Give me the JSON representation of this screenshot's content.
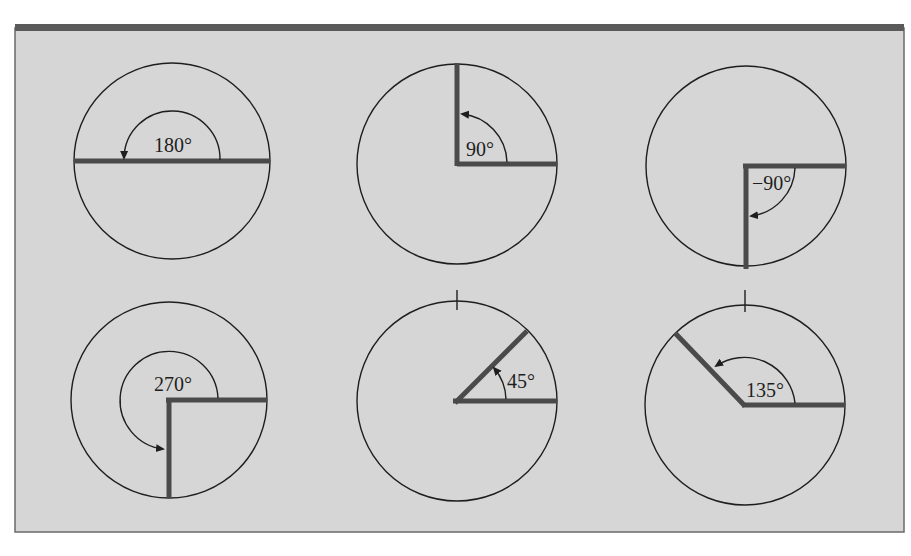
{
  "figure": {
    "colors": {
      "panel_background": "#d6d6d6",
      "panel_border": "#5a5a5a",
      "circle_stroke": "#1e1e1e",
      "ray_color": "#4a4a4a",
      "text_color": "#1e1e1e"
    },
    "panels": [
      {
        "id": "angle-180",
        "label": "180°",
        "angle_deg": 180,
        "direction": "counterclockwise",
        "has_top_tick": false
      },
      {
        "id": "angle-90",
        "label": "90°",
        "angle_deg": 90,
        "direction": "counterclockwise",
        "has_top_tick": false
      },
      {
        "id": "angle-neg90",
        "label": "−90°",
        "angle_deg": -90,
        "direction": "clockwise",
        "has_top_tick": false
      },
      {
        "id": "angle-270",
        "label": "270°",
        "angle_deg": 270,
        "direction": "counterclockwise",
        "has_top_tick": false
      },
      {
        "id": "angle-45",
        "label": "45°",
        "angle_deg": 45,
        "direction": "counterclockwise",
        "has_top_tick": true
      },
      {
        "id": "angle-135",
        "label": "135°",
        "angle_deg": 135,
        "direction": "counterclockwise",
        "has_top_tick": true
      }
    ]
  }
}
